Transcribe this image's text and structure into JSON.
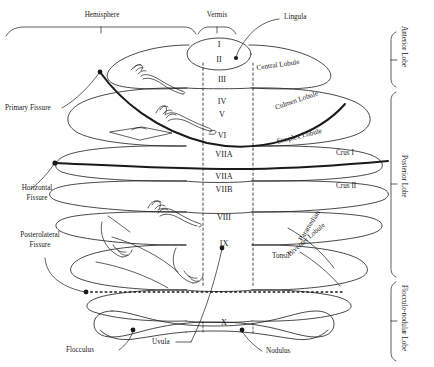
{
  "figure": {
    "line_color": "#1a1a1a",
    "background": "#ffffff"
  },
  "top_brackets": [
    {
      "name": "hemisphere",
      "label": "Hemisphere"
    },
    {
      "name": "vermis",
      "label": "Vermis"
    }
  ],
  "callouts": [
    {
      "name": "lingula",
      "label": "Lingula"
    },
    {
      "name": "primary-fissure",
      "label": "Primary Fissure"
    },
    {
      "name": "horizontal-fissure",
      "label": "Horizontal\nFissure",
      "line1": "Horizontal",
      "line2": "Fissure"
    },
    {
      "name": "posterolateral-fissure",
      "label": "Posterolateral\nFissure",
      "line1": "Posterolateral",
      "line2": "Fissure"
    },
    {
      "name": "flocculus",
      "label": "Flocculus"
    },
    {
      "name": "uvula",
      "label": "Uvula"
    },
    {
      "name": "nodulus",
      "label": "Nodulus"
    }
  ],
  "vermis_segments": [
    {
      "name": "segment-I",
      "label": "I"
    },
    {
      "name": "segment-II",
      "label": "II"
    },
    {
      "name": "segment-III",
      "label": "III"
    },
    {
      "name": "segment-IV",
      "label": "IV"
    },
    {
      "name": "segment-V",
      "label": "V"
    },
    {
      "name": "segment-VI",
      "label": "VI"
    },
    {
      "name": "segment-VIIA-upper",
      "label": "VIIA"
    },
    {
      "name": "segment-VIIA-lower",
      "label": "VIIA"
    },
    {
      "name": "segment-VIIB",
      "label": "VIIB"
    },
    {
      "name": "segment-VIII",
      "label": "VIII"
    },
    {
      "name": "segment-IX",
      "label": "IX"
    },
    {
      "name": "segment-X",
      "label": "X"
    }
  ],
  "lobules": [
    {
      "name": "central-lobule",
      "label": "Central Lobule"
    },
    {
      "name": "culmen-lobule",
      "label": "Culmen Lobule"
    },
    {
      "name": "simplex-lobule",
      "label": "Simplex Lobule"
    },
    {
      "name": "crus-i",
      "label": "Crus I"
    },
    {
      "name": "crus-ii",
      "label": "Crus II"
    },
    {
      "name": "paramedian",
      "label": "Paramedian"
    },
    {
      "name": "biventer-lobule",
      "label": "Biventer Lobule"
    },
    {
      "name": "tonsil",
      "label": "Tonsil"
    }
  ],
  "lobe_brackets": [
    {
      "name": "anterior-lobe",
      "label": "Anterior Lobe"
    },
    {
      "name": "posterior-lobe",
      "label": "Posterior Lobe"
    },
    {
      "name": "flocculonodular-lobe",
      "label": "Flocculo-nodular Lobe"
    }
  ]
}
